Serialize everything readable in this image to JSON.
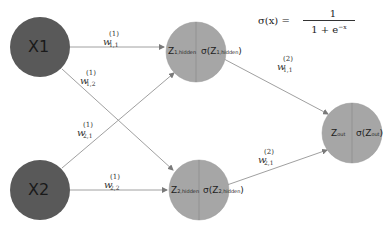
{
  "diagram": {
    "type": "neural-network",
    "colors": {
      "input_node": "#595959",
      "hidden_node": "#a6a6a6",
      "output_node": "#a6a6a6",
      "edge": "#a0a0a0",
      "divider": "#8a8a8a"
    },
    "formula": {
      "lhs": "σ(x) =",
      "numerator": "1",
      "denominator_base": "1 + e",
      "denominator_exp": "−x"
    },
    "nodes": {
      "x1": {
        "label": "X1"
      },
      "x2": {
        "label": "X2"
      },
      "h1": {
        "left": "Z",
        "left_sub": "1,hidden",
        "right": "σ(Z",
        "right_sub": "1,hidden",
        "right_close": ")"
      },
      "h2": {
        "left": "Z",
        "left_sub": "2,hidden",
        "right": "σ(Z",
        "right_sub": "2,hidden",
        "right_close": ")"
      },
      "out": {
        "left": "Z",
        "left_sub": "out",
        "right": "σ(Z",
        "right_sub": "out",
        "right_close": ")"
      }
    },
    "weights": {
      "w11_1": {
        "base": "w",
        "sup": "(1)",
        "sub": "1,1"
      },
      "w12_1": {
        "base": "w",
        "sup": "(1)",
        "sub": "1,2"
      },
      "w21_1": {
        "base": "w",
        "sup": "(1)",
        "sub": "2,1"
      },
      "w22_1": {
        "base": "w",
        "sup": "(1)",
        "sub": "2,2"
      },
      "w11_2": {
        "base": "w",
        "sup": "(2)",
        "sub": "1,1"
      },
      "w21_2": {
        "base": "w",
        "sup": "(2)",
        "sub": "2,1"
      }
    }
  }
}
